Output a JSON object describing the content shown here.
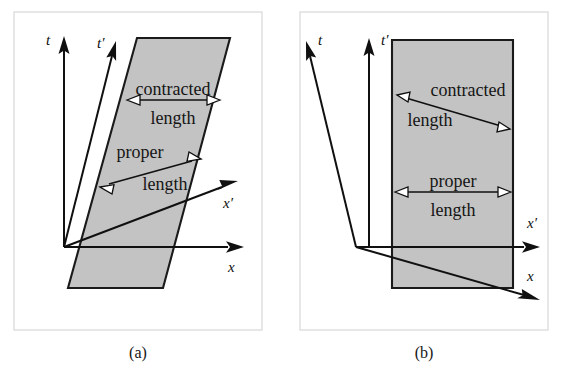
{
  "figure": {
    "background_color": "#ffffff",
    "width": 581,
    "height": 385
  },
  "style": {
    "shaded_fill": "#c3c3c3",
    "shape_stroke": "#1a1a1a",
    "axis_color": "#101010",
    "frame_stroke": "#d8d8d8",
    "text_color": "#151515"
  },
  "panels": [
    {
      "id": "a",
      "caption": "(a)",
      "frame": {
        "x": 14,
        "y": 12,
        "width": 248,
        "height": 318
      },
      "origin": {
        "x": 64,
        "y": 247
      },
      "axes": [
        {
          "name": "t",
          "label": "t",
          "tip": {
            "x": 64,
            "y": 40
          }
        },
        {
          "name": "t-prime",
          "label": "t′",
          "tip": {
            "x": 116,
            "y": 44
          }
        },
        {
          "name": "x",
          "label": "x",
          "tip": {
            "x": 242,
            "y": 247
          }
        },
        {
          "name": "x-prime",
          "label": "x′",
          "tip": {
            "x": 236,
            "y": 183
          }
        }
      ],
      "worldsheet": {
        "name": "contracted-worldsheet",
        "shape": "parallelogram",
        "points": "137,38 230,38 163,288 68,288"
      },
      "measures": [
        {
          "name": "contracted-length",
          "line1": "contracted",
          "line2": "length",
          "from": {
            "x": 130,
            "y": 100
          },
          "to": {
            "x": 217,
            "y": 100
          },
          "label1_pos": {
            "x": 173,
            "y": 95
          },
          "label2_pos": {
            "x": 173,
            "y": 124
          }
        },
        {
          "name": "proper-length",
          "line1": "proper",
          "line2": "length",
          "from": {
            "x": 103,
            "y": 186
          },
          "to": {
            "x": 198,
            "y": 160
          },
          "label1_pos": {
            "x": 140,
            "y": 158
          },
          "label2_pos": {
            "x": 165,
            "y": 190
          }
        }
      ]
    },
    {
      "id": "b",
      "caption": "(b)",
      "frame": {
        "x": 300,
        "y": 12,
        "width": 248,
        "height": 318
      },
      "origin": {
        "x": 356,
        "y": 247
      },
      "axes": [
        {
          "name": "t",
          "label": "t",
          "tip": {
            "x": 306,
            "y": 40
          }
        },
        {
          "name": "t-prime",
          "label": "t′",
          "tip": {
            "x": 369,
            "y": 40
          }
        },
        {
          "name": "x",
          "label": "x",
          "tip": {
            "x": 540,
            "y": 300
          }
        },
        {
          "name": "x-prime",
          "label": "x′",
          "tip": {
            "x": 540,
            "y": 247
          }
        }
      ],
      "worldsheet": {
        "name": "proper-worldsheet",
        "shape": "rectangle",
        "points": "392,40 513,40 513,288 392,288"
      },
      "measures": [
        {
          "name": "contracted-length",
          "line1": "contracted",
          "line2": "length",
          "from": {
            "x": 400,
            "y": 97
          },
          "to": {
            "x": 507,
            "y": 128
          },
          "label1_pos": {
            "x": 468,
            "y": 96
          },
          "label2_pos": {
            "x": 430,
            "y": 126
          }
        },
        {
          "name": "proper-length",
          "line1": "proper",
          "line2": "length",
          "from": {
            "x": 398,
            "y": 192
          },
          "to": {
            "x": 508,
            "y": 192
          },
          "label1_pos": {
            "x": 453,
            "y": 187
          },
          "label2_pos": {
            "x": 453,
            "y": 216
          }
        }
      ]
    }
  ],
  "captions": {
    "a": {
      "text": "(a)",
      "x": 138,
      "y": 358
    },
    "b": {
      "text": "(b)",
      "x": 424,
      "y": 358
    }
  },
  "axis_label_positions": {
    "a_t": {
      "x": 46,
      "y": 45
    },
    "a_t_prime": {
      "x": 97,
      "y": 48
    },
    "a_x": {
      "x": 228,
      "y": 272
    },
    "a_x_prime": {
      "x": 223,
      "y": 208
    },
    "b_t": {
      "x": 318,
      "y": 45
    },
    "b_t_prime": {
      "x": 381,
      "y": 45
    },
    "b_x": {
      "x": 527,
      "y": 281
    },
    "b_x_prime": {
      "x": 527,
      "y": 228
    }
  }
}
